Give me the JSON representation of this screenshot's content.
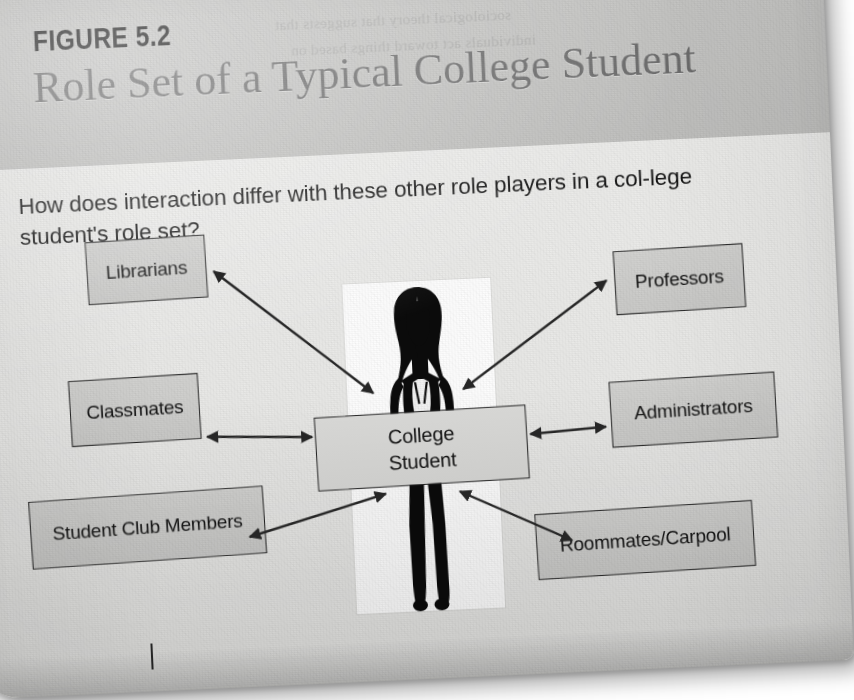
{
  "figure": {
    "label": "FIGURE 5.2",
    "title": "Role Set of a Typical College Student",
    "question": "How does interaction differ with these other role players in a col-lege student's role set?",
    "showthrough_line1": "sociological theory that suggests that",
    "showthrough_line2": "individuals act toward things based on"
  },
  "diagram": {
    "type": "hub-and-spoke",
    "center": {
      "label_line1": "College",
      "label_line2": "Student",
      "x": 352,
      "y": 452,
      "w": 212,
      "h": 74
    },
    "nodes": [
      {
        "id": "librarians",
        "label": "Librarians",
        "x": 131,
        "y": 267,
        "w": 120,
        "h": 63,
        "rotate": -1.2
      },
      {
        "id": "professors",
        "label": "Professors",
        "x": 658,
        "y": 300,
        "w": 130,
        "h": 64,
        "rotate": -1.0
      },
      {
        "id": "classmates",
        "label": "Classmates",
        "x": 108,
        "y": 405,
        "w": 130,
        "h": 66,
        "rotate": -1.0
      },
      {
        "id": "administrators",
        "label": "Administrators",
        "x": 648,
        "y": 430,
        "w": 166,
        "h": 66,
        "rotate": -1.0
      },
      {
        "id": "student-club",
        "label": "Student Club Members",
        "x": 63,
        "y": 522,
        "w": 235,
        "h": 68,
        "rotate": -1.4
      },
      {
        "id": "roommates",
        "label": "Roommates/Carpool",
        "x": 568,
        "y": 558,
        "w": 218,
        "h": 66,
        "rotate": -1.2
      }
    ],
    "connections": [
      {
        "from": "center",
        "to": "librarians",
        "style": "double-arrow"
      },
      {
        "from": "center",
        "to": "professors",
        "style": "double-arrow"
      },
      {
        "from": "center",
        "to": "classmates",
        "style": "double-arrow"
      },
      {
        "from": "center",
        "to": "administrators",
        "style": "double-arrow"
      },
      {
        "from": "center",
        "to": "student-club",
        "style": "double-arrow"
      },
      {
        "from": "center",
        "to": "roommates",
        "style": "double-arrow"
      }
    ],
    "photo": {
      "alt": "silhouette-of-female-college-student"
    }
  },
  "colors": {
    "page_background": "#ececeb",
    "header_band": "#c4c4c2",
    "body_background": "#e9e9e7",
    "node_fill": "#cdcdcb",
    "node_border": "#232323",
    "title_text": "#6d6d6d",
    "body_text": "#161616",
    "arrow": "#262626"
  }
}
